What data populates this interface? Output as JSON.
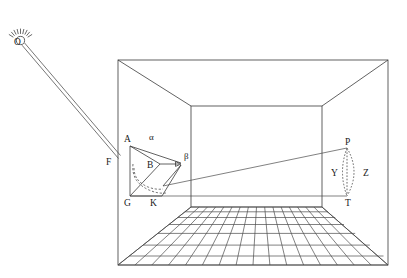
{
  "figure": {
    "type": "optics-perspective-diagram",
    "title": "",
    "background_color": "#ffffff",
    "stroke_color": "#3a3a3a",
    "width": 407,
    "height": 278
  },
  "labels": {
    "light_source": "O",
    "ray_foot": "F",
    "vertex_a": "A",
    "vertex_b": "B",
    "vertex_g": "G",
    "vertex_k": "K",
    "angle_alpha": "α",
    "angle_beta": "β",
    "point_p": "P",
    "point_t": "T",
    "segment_y": "Y",
    "segment_z": "Z"
  },
  "label_positions": {
    "light_source": {
      "x": 14,
      "y": 45
    },
    "ray_foot": {
      "x": 110,
      "y": 163
    },
    "vertex_a": {
      "x": 124,
      "y": 139
    },
    "vertex_b": {
      "x": 148,
      "y": 165
    },
    "vertex_g": {
      "x": 124,
      "y": 204
    },
    "vertex_k": {
      "x": 151,
      "y": 204
    },
    "angle_alpha": {
      "x": 151,
      "y": 137
    },
    "angle_beta": {
      "x": 185,
      "y": 158
    },
    "point_p": {
      "x": 350,
      "y": 141
    },
    "point_t": {
      "x": 350,
      "y": 204
    },
    "segment_y": {
      "x": 334,
      "y": 173
    },
    "segment_z": {
      "x": 365,
      "y": 173
    }
  },
  "geometry": {
    "room": {
      "outer_rect": {
        "x1": 118,
        "y1": 60,
        "x2": 388,
        "y2": 265
      },
      "back_wall_rect": {
        "x1": 191,
        "y1": 106,
        "x2": 322,
        "y2": 207
      },
      "note": "one-point perspective box with four diagonal corner lines"
    },
    "floor_grid": {
      "rows": 7,
      "columns": 16,
      "front_left": {
        "x": 118,
        "y": 265
      },
      "front_right": {
        "x": 388,
        "y": 265
      },
      "back_left": {
        "x": 191,
        "y": 207
      },
      "back_right": {
        "x": 322,
        "y": 207
      }
    },
    "light_source_point": {
      "x": 20,
      "y": 40
    },
    "ray_beam": {
      "from": {
        "x": 24,
        "y": 44
      },
      "to": {
        "x": 122,
        "y": 158
      },
      "style": "double-line beam"
    },
    "polygon_ABKG": {
      "A": {
        "x": 130,
        "y": 146
      },
      "B": {
        "x": 160,
        "y": 164
      },
      "beta": {
        "x": 181,
        "y": 163
      },
      "G": {
        "x": 130,
        "y": 196
      },
      "K": {
        "x": 162,
        "y": 196
      }
    },
    "sight_line": {
      "from": {
        "x": 163,
        "y": 186
      },
      "to": {
        "x": 347,
        "y": 148
      }
    },
    "floor_line_to_T": {
      "from": {
        "x": 130,
        "y": 196
      },
      "to": {
        "x": 347,
        "y": 196
      }
    },
    "lens_shape": {
      "top": {
        "x": 347,
        "y": 148
      },
      "bottom": {
        "x": 347,
        "y": 196
      },
      "left_edge": "vertical dotted line Y",
      "right_edge": "dotted arc Z bulging right"
    },
    "dashed_arcs": {
      "count": 2,
      "description": "two dashed curves sweeping from near A/B down across to K"
    }
  },
  "elements": {
    "light_source_name": "light-source-O",
    "beam_name": "light-beam",
    "room_name": "perspective-room",
    "floor_name": "floor-grid",
    "object_name": "object-polygon-ABKG",
    "image_name": "image-lens-PT"
  }
}
